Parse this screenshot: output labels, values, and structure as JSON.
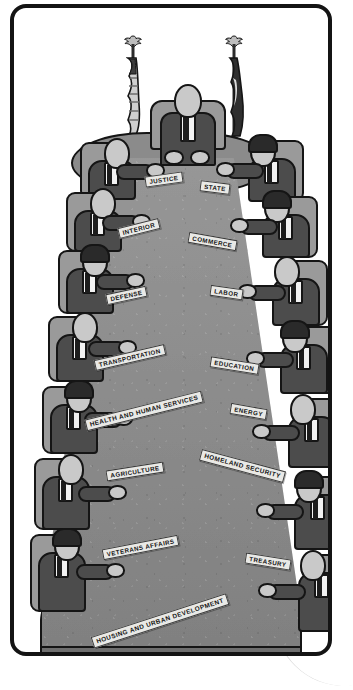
{
  "illustration": {
    "title": "Cabinet meeting table with executive department nameplates",
    "palette": {
      "paper": "#ffffff",
      "frame_border": "#141414",
      "table_surface": "#8b8b8b",
      "table_edge": "#6f6f6f",
      "suit": "#4c4c4c",
      "chair": "#9a9a9a",
      "skin": "#c9c9c9",
      "shirt": "#f2f2f2",
      "hair": "#2a2a2a",
      "nameplate_face": "#e9e9e6",
      "ink": "#151515"
    },
    "head_of_table": {
      "role": "president-figure",
      "seat": "head"
    },
    "flags": [
      {
        "name": "us-flag",
        "side": "left",
        "finial": "eagle-finial"
      },
      {
        "name": "presidential-flag",
        "side": "right",
        "finial": "eagle-finial"
      }
    ],
    "nameplates": [
      {
        "label": "JUSTICE",
        "x": 131,
        "y": 166,
        "rot": -8,
        "side": "left"
      },
      {
        "label": "STATE",
        "x": 186,
        "y": 174,
        "rot": 7,
        "side": "right"
      },
      {
        "label": "INTERIOR",
        "x": 104,
        "y": 215,
        "rot": -14,
        "side": "left"
      },
      {
        "label": "COMMERCE",
        "x": 174,
        "y": 228,
        "rot": 10,
        "side": "right"
      },
      {
        "label": "DEFENSE",
        "x": 92,
        "y": 282,
        "rot": -12,
        "side": "left"
      },
      {
        "label": "LABOR",
        "x": 196,
        "y": 279,
        "rot": 8,
        "side": "right"
      },
      {
        "label": "TRANSPORTATION",
        "x": 80,
        "y": 344,
        "rot": -13,
        "side": "left"
      },
      {
        "label": "EDUCATION",
        "x": 196,
        "y": 352,
        "rot": 9,
        "side": "right"
      },
      {
        "label": "HEALTH AND HUMAN SERVICES",
        "x": 70,
        "y": 397,
        "rot": -14,
        "side": "left"
      },
      {
        "label": "ENERGY",
        "x": 216,
        "y": 398,
        "rot": 10,
        "side": "right"
      },
      {
        "label": "AGRICULTURE",
        "x": 92,
        "y": 458,
        "rot": -9,
        "side": "left"
      },
      {
        "label": "HOMELAND SECURITY",
        "x": 185,
        "y": 452,
        "rot": 15,
        "side": "right"
      },
      {
        "label": "VETERANS AFFAIRS",
        "x": 88,
        "y": 534,
        "rot": -11,
        "side": "left"
      },
      {
        "label": "TREASURY",
        "x": 231,
        "y": 548,
        "rot": 9,
        "side": "right"
      },
      {
        "label": "HOUSING AND URBAN DEVELOPMENT",
        "x": 75,
        "y": 607,
        "rot": -18,
        "side": "bottom"
      }
    ],
    "seats": [
      {
        "name": "seat-head",
        "x": 140,
        "y": 78,
        "w": 64,
        "h": 72,
        "facing": "front",
        "hair": "light"
      },
      {
        "name": "seat-left-1",
        "x": 62,
        "y": 128,
        "w": 78,
        "h": 66,
        "facing": "right",
        "hair": "light"
      },
      {
        "name": "seat-right-1",
        "x": 208,
        "y": 126,
        "w": 80,
        "h": 70,
        "facing": "left",
        "hair": "dark"
      },
      {
        "name": "seat-left-2",
        "x": 48,
        "y": 178,
        "w": 78,
        "h": 68,
        "facing": "right",
        "hair": "light"
      },
      {
        "name": "seat-right-2",
        "x": 222,
        "y": 182,
        "w": 80,
        "h": 70,
        "facing": "left",
        "hair": "dark"
      },
      {
        "name": "seat-left-3",
        "x": 40,
        "y": 236,
        "w": 80,
        "h": 72,
        "facing": "right",
        "hair": "dark"
      },
      {
        "name": "seat-right-3",
        "x": 230,
        "y": 246,
        "w": 82,
        "h": 74,
        "facing": "left",
        "hair": "light"
      },
      {
        "name": "seat-left-4",
        "x": 30,
        "y": 302,
        "w": 82,
        "h": 74,
        "facing": "right",
        "hair": "light"
      },
      {
        "name": "seat-right-4",
        "x": 238,
        "y": 312,
        "w": 82,
        "h": 76,
        "facing": "left",
        "hair": "dark"
      },
      {
        "name": "seat-left-5",
        "x": 24,
        "y": 372,
        "w": 84,
        "h": 76,
        "facing": "right",
        "hair": "dark"
      },
      {
        "name": "seat-right-5",
        "x": 244,
        "y": 384,
        "w": 84,
        "h": 78,
        "facing": "left",
        "hair": "light"
      },
      {
        "name": "seat-left-6",
        "x": 16,
        "y": 444,
        "w": 86,
        "h": 80,
        "facing": "right",
        "hair": "light"
      },
      {
        "name": "seat-right-6",
        "x": 248,
        "y": 462,
        "w": 86,
        "h": 82,
        "facing": "left",
        "hair": "dark"
      },
      {
        "name": "seat-left-7",
        "x": 12,
        "y": 520,
        "w": 88,
        "h": 86,
        "facing": "right",
        "hair": "dark"
      },
      {
        "name": "seat-right-7",
        "x": 250,
        "y": 540,
        "w": 88,
        "h": 86,
        "facing": "left",
        "hair": "light"
      }
    ]
  }
}
